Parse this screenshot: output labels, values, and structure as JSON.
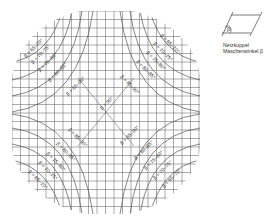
{
  "legend": {
    "title_line1": "Netzkuppel",
    "title_line2": "Maschenwinkel β",
    "angle_symbol": "β"
  },
  "diagram": {
    "center_label": "β = 90°",
    "zones": [
      {
        "range": "β = 65–70°"
      },
      {
        "range": "β = 70–75°"
      },
      {
        "range": "β = 75–80°"
      },
      {
        "range": "β = 80–85°"
      },
      {
        "range": "β = 85–90°"
      }
    ],
    "quadrant_labels": {
      "top_left": [
        "β = 65–70°",
        "β = 70–75°",
        "β = 75–80°",
        "β = 80–85°",
        "β = 85–90°"
      ],
      "top_right": [
        "β = 65–70°",
        "β = 70–75°",
        "β = 75–80°",
        "β = 80–85°",
        "β = 85–90°"
      ],
      "bottom_left": [
        "β = 85–90°",
        "β = 80–85°",
        "β = 75–80°",
        "β = 70–75°",
        "β = 65–70°"
      ],
      "bottom_right": [
        "β = 85–90°",
        "β = 80–85°",
        "β = 75–80°",
        "β = 70–75°",
        "β = 65–70°"
      ]
    },
    "colors": {
      "grid": "#555555",
      "text": "#333333",
      "background": "#ffffff"
    }
  }
}
